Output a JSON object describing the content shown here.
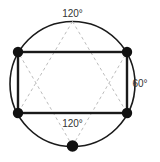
{
  "figure": {
    "canvas": {
      "width": 160,
      "height": 162,
      "background": "#ffffff"
    },
    "colors": {
      "circle_stroke": "#1a1a1a",
      "rect_stroke": "#1a1a1a",
      "dashed_stroke": "#bdbdbd",
      "vertex_fill": "#111111",
      "label_text": "#333333"
    },
    "circle": {
      "cx": 72.5,
      "cy": 84,
      "r": 62.5,
      "stroke_width": 1.6
    },
    "rectangle": {
      "x1": 18,
      "y1": 52,
      "x2": 127,
      "y2": 113,
      "stroke_width": 2.4
    },
    "vertices": [
      {
        "name": "top-left-vertex",
        "cx": 18,
        "cy": 52,
        "r": 5.2
      },
      {
        "name": "top-right-vertex",
        "cx": 127,
        "cy": 52,
        "r": 5.2
      },
      {
        "name": "bottom-left-vertex",
        "cx": 18,
        "cy": 113,
        "r": 5.2
      },
      {
        "name": "bottom-right-vertex",
        "cx": 127,
        "cy": 113,
        "r": 5.2
      },
      {
        "name": "bottom-center-vertex",
        "cx": 72.5,
        "cy": 146,
        "r": 5.8
      }
    ],
    "apex_points": {
      "top": {
        "cx": 72.5,
        "cy": 21.5
      },
      "bottom": {
        "cx": 72.5,
        "cy": 146
      }
    },
    "dashed_edges": [
      {
        "name": "dash-top-apex-to-bottom-left",
        "x1": 72.5,
        "y1": 21.5,
        "x2": 18,
        "y2": 113
      },
      {
        "name": "dash-top-apex-to-bottom-right",
        "x1": 72.5,
        "y1": 21.5,
        "x2": 127,
        "y2": 113
      },
      {
        "name": "dash-bottom-apex-to-top-left",
        "x1": 72.5,
        "y1": 146,
        "x2": 18,
        "y2": 52
      },
      {
        "name": "dash-bottom-apex-to-top-right",
        "x1": 72.5,
        "y1": 146,
        "x2": 127,
        "y2": 52
      },
      {
        "name": "dash-left-side",
        "x1": 18,
        "y1": 52,
        "x2": 18,
        "y2": 113
      },
      {
        "name": "dash-right-side",
        "x1": 127,
        "y1": 52,
        "x2": 127,
        "y2": 113
      }
    ],
    "dash_pattern": "3,3",
    "dash_stroke_width": 1,
    "labels": [
      {
        "name": "angle-label-top",
        "text": "120°",
        "x": 72.5,
        "y": 17,
        "anchor": "middle"
      },
      {
        "name": "angle-label-right",
        "text": "60°",
        "x": 140,
        "y": 87,
        "anchor": "middle"
      },
      {
        "name": "angle-label-bottom",
        "text": "120°",
        "x": 72.5,
        "y": 127,
        "anchor": "middle"
      }
    ]
  }
}
